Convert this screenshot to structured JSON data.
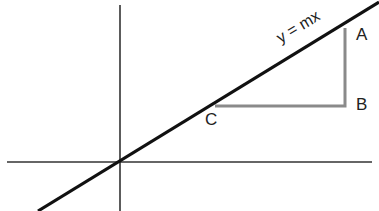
{
  "diagram": {
    "equation_label": "y = mx",
    "points": [
      {
        "name": "A",
        "x": 345,
        "y": 28
      },
      {
        "name": "B",
        "x": 345,
        "y": 106
      },
      {
        "name": "C",
        "x": 215,
        "y": 106
      }
    ],
    "axes": {
      "origin": [
        120,
        162
      ],
      "x_axis": [
        7,
        372
      ],
      "y_axis": [
        5,
        211
      ]
    },
    "line": {
      "from": [
        38,
        211
      ],
      "to": [
        379,
        2
      ]
    },
    "colors": {
      "line": "#111111",
      "axes": "#333333",
      "triangle": "#8a8a8a"
    },
    "labels": {
      "A": "A",
      "B": "B",
      "C": "C"
    }
  }
}
